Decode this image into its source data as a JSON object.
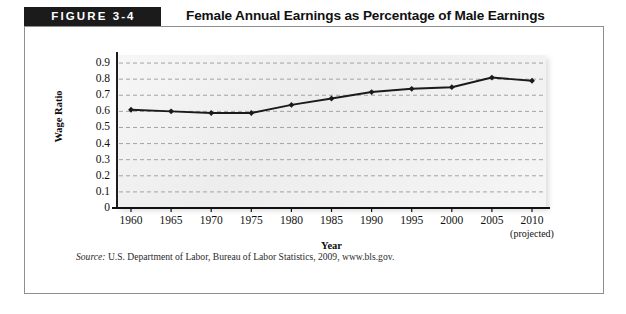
{
  "figure": {
    "badge_label": "FIGURE 3-4",
    "title": "Female Annual Earnings as Percentage of Male Earnings",
    "source_lead": "Source:",
    "source_text": "U.S. Department of Labor, Bureau of Labor Statistics, 2009, www.bls.gov.",
    "projected_note": "(projected)"
  },
  "colors": {
    "badge_bg": "#1b1b1b",
    "badge_text": "#ffffff",
    "frame_border": "#8e8e90",
    "plot_bg": "#ececec",
    "gridline": "#9a9a9a",
    "series_line": "#1a1a1a",
    "axis": "#111111"
  },
  "chart_data": {
    "type": "line",
    "title": "Female Annual Earnings as Percentage of Male Earnings",
    "xlabel": "Year",
    "ylabel": "Wage Ratio",
    "x": [
      1960,
      1965,
      1970,
      1975,
      1980,
      1985,
      1990,
      1995,
      2000,
      2005,
      2010
    ],
    "xtick_labels": [
      "1960",
      "1965",
      "1970",
      "1975",
      "1980",
      "1985",
      "1990",
      "1995",
      "2000",
      "2005",
      "2010"
    ],
    "values": [
      0.61,
      0.6,
      0.59,
      0.59,
      0.64,
      0.68,
      0.72,
      0.74,
      0.75,
      0.81,
      0.79
    ],
    "ytick_labels": [
      "0.9",
      "0.8",
      "0.7",
      "0.6",
      "0.5",
      "0.4",
      "0.3",
      "0.2",
      "0.1",
      "0"
    ],
    "ytick_values": [
      0.9,
      0.8,
      0.7,
      0.6,
      0.5,
      0.4,
      0.3,
      0.2,
      0.1,
      0
    ],
    "ylim": [
      0,
      0.95
    ],
    "xlim": [
      1960,
      2010
    ],
    "grid": true,
    "grid_style": "dashed-horizontal",
    "legend": "none",
    "marker": "diamond",
    "annotations": [
      "(projected)"
    ]
  }
}
